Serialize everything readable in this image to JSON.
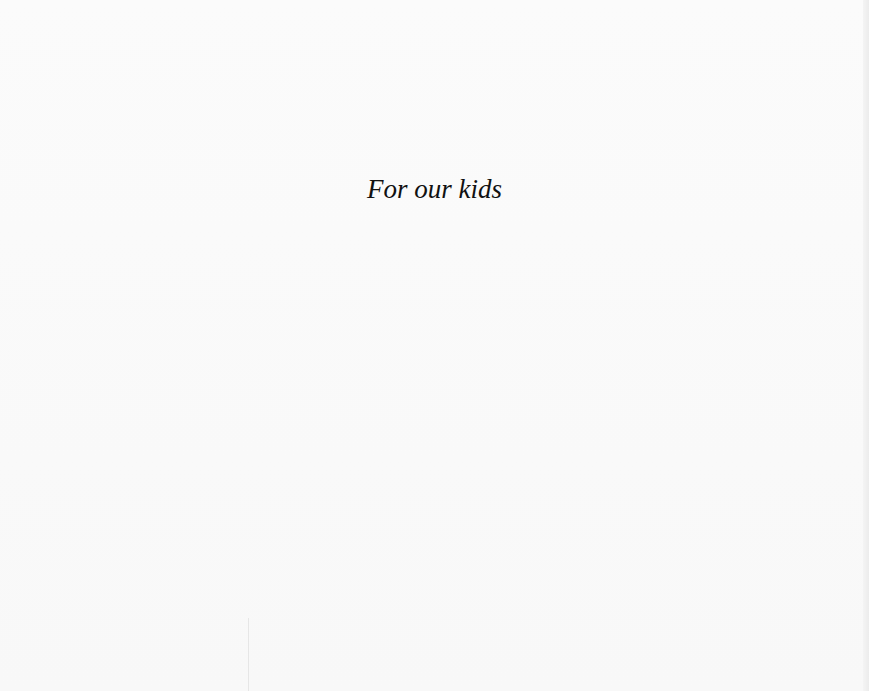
{
  "page": {
    "dedication": "For our kids"
  }
}
